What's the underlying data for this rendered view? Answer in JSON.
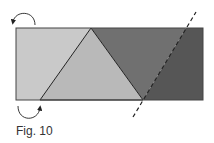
{
  "figure": {
    "caption": "Fig. 10",
    "colors": {
      "light_left": "#c8c8c8",
      "triangle": "#b8b8b8",
      "mid_dark": "#6e6e6e",
      "darkest": "#555555",
      "outline": "#333333"
    },
    "shapes": [
      {
        "name": "strip-rectangle",
        "type": "rectangle"
      },
      {
        "name": "center-triangle",
        "type": "triangle"
      },
      {
        "name": "fold-line",
        "type": "dashed-line"
      },
      {
        "name": "top-left-arrow",
        "type": "curved-arrow"
      },
      {
        "name": "bottom-left-arrow",
        "type": "curved-arrow"
      }
    ]
  }
}
